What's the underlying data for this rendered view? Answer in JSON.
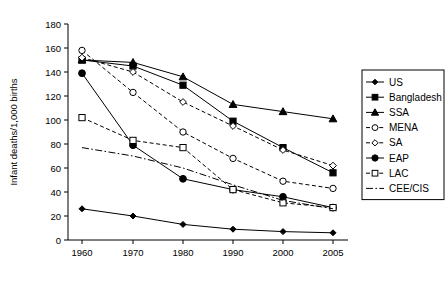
{
  "chart_data": {
    "type": "line",
    "title": "",
    "xlabel": "",
    "ylabel": "Infant deaths/1,000 births",
    "categories": [
      "1960",
      "1970",
      "1980",
      "1990",
      "2000",
      "2005"
    ],
    "x": [
      1960,
      1970,
      1980,
      1990,
      2000,
      2005
    ],
    "xlim": [
      1955,
      2010
    ],
    "ylim": [
      0,
      180
    ],
    "yticks": [
      "0",
      "20",
      "40",
      "60",
      "80",
      "100",
      "120",
      "140",
      "160",
      "180"
    ],
    "ytick_values": [
      0,
      20,
      40,
      60,
      80,
      100,
      120,
      140,
      160,
      180
    ],
    "grid": false,
    "legend_position": "right",
    "series": [
      {
        "name": "US",
        "values": [
          26,
          20,
          13,
          9,
          7,
          6
        ],
        "marker": "filled-diamond",
        "linestyle": "solid"
      },
      {
        "name": "Bangladesh",
        "values": [
          150,
          145,
          129,
          99,
          77,
          56
        ],
        "marker": "filled-square",
        "linestyle": "solid"
      },
      {
        "name": "SSA",
        "values": [
          150,
          148,
          136,
          113,
          107,
          101
        ],
        "marker": "filled-triangle",
        "linestyle": "solid"
      },
      {
        "name": "MENA",
        "values": [
          158,
          123,
          90,
          68,
          49,
          43
        ],
        "marker": "open-circle",
        "linestyle": "dashed"
      },
      {
        "name": "SA",
        "values": [
          152,
          140,
          115,
          95,
          75,
          62
        ],
        "marker": "open-diamond",
        "linestyle": "dashed"
      },
      {
        "name": "EAP",
        "values": [
          139,
          79,
          51,
          42,
          36,
          27
        ],
        "marker": "filled-circle",
        "linestyle": "solid"
      },
      {
        "name": "LAC",
        "values": [
          102,
          83,
          77,
          42,
          31,
          27
        ],
        "marker": "open-square",
        "linestyle": "dashed"
      },
      {
        "name": "CEE/CIS",
        "values": [
          77,
          70,
          60,
          46,
          33,
          26
        ],
        "marker": "none",
        "linestyle": "dashdot"
      }
    ]
  },
  "colors": {
    "ink": "#000000",
    "paper": "#ffffff"
  }
}
